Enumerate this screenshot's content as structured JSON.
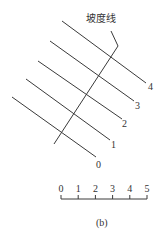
{
  "diagram": {
    "slope_line_label": "坡度线",
    "caption": "(b)",
    "contour_lines": [
      {
        "label": "4",
        "x1": 62,
        "y1": 21,
        "x2": 146,
        "y2": 83,
        "lx": 148,
        "ly": 90
      },
      {
        "label": "3",
        "x1": 50,
        "y1": 41,
        "x2": 134,
        "y2": 101,
        "lx": 135,
        "ly": 109
      },
      {
        "label": "2",
        "x1": 38,
        "y1": 61,
        "x2": 122,
        "y2": 119,
        "lx": 122,
        "ly": 127
      },
      {
        "label": "1",
        "x1": 26,
        "y1": 79,
        "x2": 110,
        "y2": 140,
        "lx": 111,
        "ly": 148
      },
      {
        "label": "0",
        "x1": 12,
        "y1": 97,
        "x2": 96,
        "y2": 157,
        "lx": 96,
        "ly": 168
      }
    ],
    "scale_bar": {
      "ticks": [
        "0",
        "1",
        "2",
        "3",
        "4",
        "5"
      ]
    }
  }
}
